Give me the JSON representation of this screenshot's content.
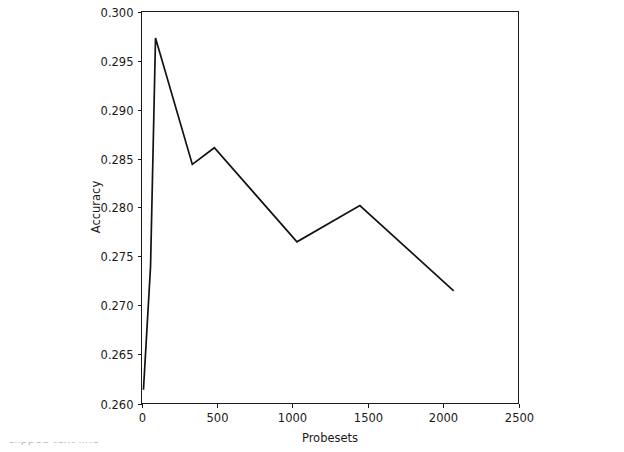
{
  "figure": {
    "background_color": "#ffffff",
    "line_color": "#121212",
    "axis_color": "#1a1a1a"
  },
  "chart_data": {
    "type": "line",
    "title": "",
    "xlabel": "Probesets",
    "ylabel": "Accuracy",
    "xlim": [
      0,
      2500
    ],
    "ylim": [
      0.26,
      0.3
    ],
    "grid": false,
    "legend": null,
    "xticks": [
      0,
      500,
      1000,
      1500,
      2000,
      2500
    ],
    "xticklabels": [
      "0",
      "500",
      "1000",
      "1500",
      "2000",
      "2500"
    ],
    "yticks": [
      0.26,
      0.265,
      0.27,
      0.275,
      0.28,
      0.285,
      0.29,
      0.295,
      0.3
    ],
    "yticklabels": [
      "0.260",
      "0.265",
      "0.270",
      "0.275",
      "0.280",
      "0.285",
      "0.290",
      "0.295",
      "0.300"
    ],
    "series": [
      {
        "name": "Accuracy",
        "x": [
          13,
          60,
          93,
          337,
          483,
          1031,
          1448,
          2070
        ],
        "y": [
          0.2614,
          0.274,
          0.2973,
          0.2844,
          0.2861,
          0.2765,
          0.2802,
          0.2715
        ]
      }
    ]
  },
  "caption": {
    "text": "clipped text line"
  }
}
